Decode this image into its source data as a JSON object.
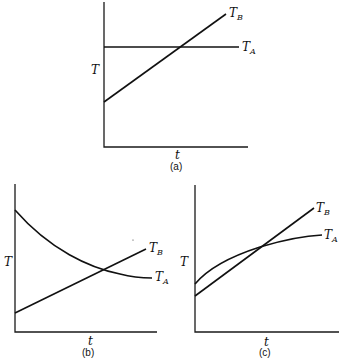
{
  "figure": {
    "panels": [
      {
        "id": "a",
        "caption": "(a)",
        "x_label": "t",
        "y_label": "T",
        "curves": [
          {
            "name": "T_A",
            "label_main": "T",
            "label_sub": "A",
            "shape": "constant",
            "start": 0.72,
            "end": 0.72
          },
          {
            "name": "T_B",
            "label_main": "T",
            "label_sub": "B",
            "shape": "linear-increasing",
            "start": 0.31,
            "end": 0.92
          }
        ]
      },
      {
        "id": "b",
        "caption": "(b)",
        "x_label": "t",
        "y_label": "T",
        "curves": [
          {
            "name": "T_A",
            "label_main": "T",
            "label_sub": "A",
            "shape": "decaying",
            "start": 0.83,
            "end": 0.37
          },
          {
            "name": "T_B",
            "label_main": "T",
            "label_sub": "B",
            "shape": "linear-increasing",
            "start": 0.13,
            "end": 0.56
          }
        ]
      },
      {
        "id": "c",
        "caption": "(c)",
        "x_label": "t",
        "y_label": "T",
        "curves": [
          {
            "name": "T_A",
            "label_main": "T",
            "label_sub": "A",
            "shape": "concave-increasing",
            "start": 0.33,
            "end": 0.67
          },
          {
            "name": "T_B",
            "label_main": "T",
            "label_sub": "B",
            "shape": "linear-increasing",
            "start": 0.25,
            "end": 0.85
          }
        ]
      }
    ]
  }
}
